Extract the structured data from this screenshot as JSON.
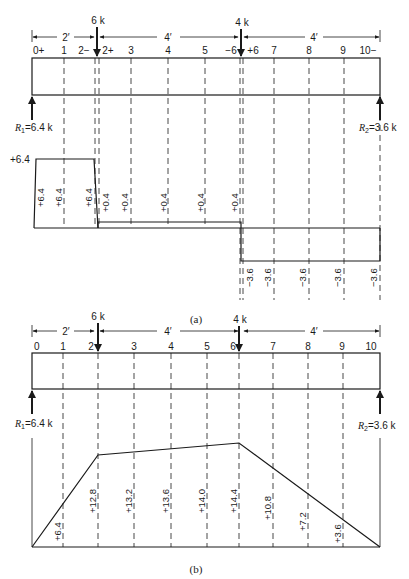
{
  "diagram_a": {
    "caption": "(a)",
    "loads": [
      {
        "label": "6 k",
        "station": 2
      },
      {
        "label": "4 k",
        "station": 6
      }
    ],
    "spans": [
      "2′",
      "4′",
      "4′"
    ],
    "stations": [
      "0+",
      "1",
      "2−",
      "2+",
      "3",
      "4",
      "5",
      "−6",
      "+6",
      "7",
      "8",
      "9",
      "10−"
    ],
    "reactions": {
      "left": {
        "sym": "R",
        "sub": "1",
        "value": "=6.4 k"
      },
      "right": {
        "sym": "R",
        "sub": "2",
        "value": "=3.6 k"
      }
    },
    "shear_max_label": "+6.4",
    "shear_values": [
      "+6.4",
      "+6.4",
      "+6.4",
      "+0.4",
      "+0.4",
      "+0.4",
      "+0.4",
      "+0.4",
      "−3.6",
      "−3.6",
      "−3.6",
      "−3.6",
      "−3.6"
    ]
  },
  "diagram_b": {
    "caption": "(b)",
    "loads": [
      {
        "label": "6 k",
        "station": 2
      },
      {
        "label": "4 k",
        "station": 6
      }
    ],
    "spans": [
      "2′",
      "4′",
      "4′"
    ],
    "stations": [
      "0",
      "1",
      "2",
      "3",
      "4",
      "5",
      "6",
      "7",
      "8",
      "9",
      "10"
    ],
    "reactions": {
      "left": {
        "sym": "R",
        "sub": "1",
        "value": "=6.4 k"
      },
      "right": {
        "sym": "R",
        "sub": "2",
        "value": "=3.6 k"
      }
    },
    "moment_values": [
      "+6.4",
      "+12.8",
      "+13.2",
      "+13.6",
      "+14.0",
      "+14.4",
      "+10.8",
      "+7.2",
      "+3.6"
    ]
  }
}
